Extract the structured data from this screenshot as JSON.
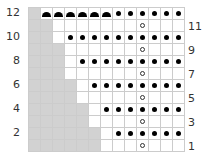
{
  "chart": {
    "columns": 13,
    "rows": 12,
    "colors": {
      "no_stitch": "#d2d2d2",
      "grid": "#cccccc",
      "symbol": "#000000"
    },
    "legend_symbols": {
      "dot": "purl-dot",
      "ring": "yarn-over",
      "arc": "bind-off-arc",
      "gray": "no-stitch"
    },
    "row_labels_left": [
      "12",
      "10",
      "8",
      "6",
      "4",
      "2"
    ],
    "row_labels_right": [
      "11",
      "9",
      "7",
      "5",
      "3",
      "1"
    ],
    "grid": [
      {
        "row": 12,
        "cells": [
          "gray",
          "arc",
          "arc",
          "arc",
          "arc",
          "arc",
          "arc",
          "dot",
          "dot",
          "dot",
          "dot",
          "dot",
          "dot"
        ]
      },
      {
        "row": 11,
        "cells": [
          "gray",
          "gray",
          "",
          "",
          "",
          "",
          "",
          "",
          "",
          "ring",
          "",
          "",
          ""
        ]
      },
      {
        "row": 10,
        "cells": [
          "gray",
          "gray",
          "",
          "dot",
          "dot",
          "dot",
          "dot",
          "dot",
          "dot",
          "dot",
          "dot",
          "dot",
          "dot"
        ]
      },
      {
        "row": 9,
        "cells": [
          "gray",
          "gray",
          "gray",
          "",
          "",
          "",
          "",
          "",
          "",
          "ring",
          "",
          "",
          ""
        ]
      },
      {
        "row": 8,
        "cells": [
          "gray",
          "gray",
          "gray",
          "",
          "dot",
          "dot",
          "dot",
          "dot",
          "dot",
          "dot",
          "dot",
          "dot",
          "dot"
        ]
      },
      {
        "row": 7,
        "cells": [
          "gray",
          "gray",
          "gray",
          "",
          "",
          "",
          "",
          "",
          "",
          "ring",
          "",
          "",
          ""
        ]
      },
      {
        "row": 6,
        "cells": [
          "gray",
          "gray",
          "gray",
          "gray",
          "",
          "dot",
          "dot",
          "dot",
          "dot",
          "dot",
          "dot",
          "dot",
          "dot"
        ]
      },
      {
        "row": 5,
        "cells": [
          "gray",
          "gray",
          "gray",
          "gray",
          "",
          "",
          "",
          "",
          "",
          "ring",
          "",
          "",
          ""
        ]
      },
      {
        "row": 4,
        "cells": [
          "gray",
          "gray",
          "gray",
          "gray",
          "gray",
          "",
          "dot",
          "dot",
          "dot",
          "dot",
          "dot",
          "dot",
          "dot"
        ]
      },
      {
        "row": 3,
        "cells": [
          "gray",
          "gray",
          "gray",
          "gray",
          "gray",
          "",
          "",
          "",
          "",
          "ring",
          "",
          "",
          ""
        ]
      },
      {
        "row": 2,
        "cells": [
          "gray",
          "gray",
          "gray",
          "gray",
          "gray",
          "gray",
          "",
          "dot",
          "dot",
          "dot",
          "dot",
          "dot",
          "dot"
        ]
      },
      {
        "row": 1,
        "cells": [
          "gray",
          "gray",
          "gray",
          "gray",
          "gray",
          "gray",
          "",
          "",
          "",
          "ring",
          "",
          "",
          ""
        ]
      }
    ]
  }
}
